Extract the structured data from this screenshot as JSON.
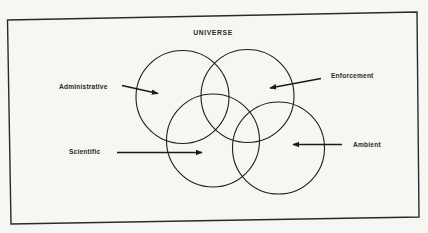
{
  "diagram": {
    "title": "UNIVERSE",
    "colors": {
      "background": "#f6f6f3",
      "stroke": "#1e1e1e",
      "text": "#2a2a2a"
    },
    "sets": [
      {
        "id": "administrative",
        "label": "Administrative"
      },
      {
        "id": "enforcement",
        "label": "Enforcement"
      },
      {
        "id": "scientific",
        "label": "Scientific"
      },
      {
        "id": "ambient",
        "label": "Ambient"
      }
    ]
  }
}
